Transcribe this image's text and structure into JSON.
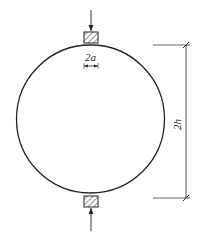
{
  "diagram": {
    "labels": {
      "strip_width": "2a",
      "height": "2h"
    },
    "colors": {
      "stroke": "#222222",
      "background": "#ffffff"
    },
    "elements": [
      "circle",
      "top-loading-strip",
      "bottom-loading-strip",
      "top-load-arrow",
      "bottom-load-arrow",
      "strip-width-dimension",
      "height-dimension"
    ]
  }
}
